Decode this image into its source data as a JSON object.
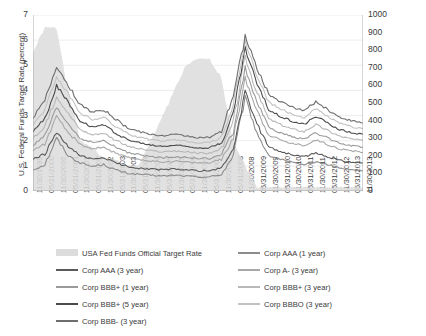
{
  "chart_data": {
    "type": "line",
    "title": "",
    "xlabel": "",
    "ylabel": "U.S. Federal Funds Target Rate (percent)",
    "y2label": "Korean Corporate Bond Spreads (basis points)",
    "ylim": [
      0,
      7
    ],
    "y2lim": [
      0,
      1000
    ],
    "grid": true,
    "legend_position": "bottom",
    "yticks": [
      "0",
      "1",
      "2",
      "3",
      "4",
      "5",
      "6",
      "7"
    ],
    "y2ticks": [
      "0",
      "100",
      "200",
      "300",
      "400",
      "500",
      "600",
      "700",
      "800",
      "900",
      "1000"
    ],
    "categories": [
      "11/30/1999",
      "05/31/2000",
      "11/30/2000",
      "05/31/2001",
      "11/30/2001",
      "05/31/2002",
      "11/30/2002",
      "05/31/2003",
      "11/30/2003",
      "05/31/2004",
      "11/30/2004",
      "05/31/2005",
      "11/30/2005",
      "05/31/2006",
      "11/30/2006",
      "05/31/2007",
      "11/30/2007",
      "05/31/2008",
      "11/30/2008",
      "05/31/2009",
      "11/30/2009",
      "05/31/2010",
      "11/30/2010",
      "05/31/2011",
      "11/30/2011",
      "05/31/2012",
      "11/30/2012",
      "05/31/2013",
      "11/30/2013"
    ],
    "area_series": {
      "name": "USA Fed Funds Official Target Rate",
      "axis": "left",
      "color": "#dcdcdc",
      "values": [
        5.5,
        6.5,
        6.5,
        4.0,
        2.0,
        1.75,
        1.25,
        1.25,
        1.0,
        1.0,
        2.0,
        3.0,
        4.0,
        5.0,
        5.25,
        5.25,
        4.5,
        2.0,
        1.0,
        0.15,
        0.15,
        0.15,
        0.15,
        0.15,
        0.15,
        0.15,
        0.15,
        0.15,
        0.15
      ]
    },
    "series": [
      {
        "name": "Corp AAA (1 year)",
        "axis": "right",
        "color": "#8c8c8c",
        "values": [
          120,
          150,
          300,
          200,
          160,
          140,
          150,
          120,
          100,
          95,
          90,
          85,
          90,
          85,
          80,
          80,
          95,
          200,
          530,
          330,
          200,
          180,
          160,
          150,
          165,
          150,
          130,
          120,
          115
        ]
      },
      {
        "name": "Corp AAA (3 year)",
        "axis": "right",
        "color": "#5a5a5a",
        "values": [
          180,
          210,
          330,
          250,
          200,
          180,
          190,
          160,
          140,
          130,
          125,
          120,
          125,
          120,
          115,
          115,
          130,
          240,
          560,
          380,
          250,
          225,
          205,
          195,
          215,
          195,
          175,
          165,
          160
        ]
      },
      {
        "name": "Corp A- (3 year)",
        "axis": "right",
        "color": "#a8a8a8",
        "values": [
          230,
          270,
          420,
          330,
          265,
          240,
          250,
          215,
          190,
          180,
          170,
          165,
          170,
          165,
          160,
          160,
          180,
          300,
          640,
          460,
          320,
          290,
          270,
          260,
          290,
          265,
          240,
          228,
          220
        ]
      },
      {
        "name": "Corp BBB+ (1 year)",
        "axis": "right",
        "color": "#9a9a9a",
        "values": [
          260,
          310,
          470,
          380,
          300,
          275,
          285,
          250,
          220,
          205,
          195,
          190,
          195,
          190,
          185,
          185,
          205,
          340,
          700,
          505,
          360,
          330,
          308,
          296,
          330,
          300,
          272,
          258,
          250
        ]
      },
      {
        "name": "Corp BBB+ (3 year)",
        "axis": "right",
        "color": "#b8b8b8",
        "values": [
          300,
          360,
          540,
          440,
          350,
          320,
          330,
          290,
          255,
          240,
          228,
          222,
          228,
          222,
          215,
          215,
          240,
          390,
          760,
          560,
          410,
          378,
          352,
          338,
          378,
          344,
          312,
          296,
          286
        ]
      },
      {
        "name": "Corp BBB+ (5 year)",
        "axis": "right",
        "color": "#4a4a4a",
        "values": [
          340,
          410,
          600,
          500,
          400,
          365,
          375,
          330,
          292,
          274,
          260,
          254,
          260,
          254,
          246,
          246,
          274,
          440,
          810,
          610,
          460,
          424,
          396,
          380,
          424,
          386,
          350,
          332,
          322
        ]
      },
      {
        "name": "Corp BBBO (3 year)",
        "axis": "right",
        "color": "#c2c2c2",
        "values": [
          380,
          460,
          650,
          550,
          445,
          405,
          418,
          368,
          326,
          306,
          290,
          284,
          290,
          284,
          275,
          275,
          306,
          490,
          850,
          655,
          505,
          466,
          436,
          418,
          466,
          424,
          385,
          366,
          354
        ]
      },
      {
        "name": "Corp BBB- (3 year)",
        "axis": "right",
        "color": "#6e6e6e",
        "values": [
          420,
          510,
          710,
          600,
          490,
          448,
          462,
          408,
          360,
          338,
          322,
          314,
          322,
          314,
          304,
          304,
          338,
          545,
          880,
          700,
          550,
          508,
          476,
          456,
          508,
          462,
          420,
          400,
          386
        ]
      }
    ]
  },
  "legend": {
    "items": [
      {
        "label": "USA Fed Funds Official Target Rate",
        "type": "area",
        "color": "#dcdcdc",
        "col": 0,
        "row": 0
      },
      {
        "label": "Corp AAA (1 year)",
        "type": "line",
        "color": "#8c8c8c",
        "col": 1,
        "row": 0
      },
      {
        "label": "Corp AAA (3 year)",
        "type": "line",
        "color": "#5a5a5a",
        "col": 0,
        "row": 1
      },
      {
        "label": "Corp A- (3 year)",
        "type": "line",
        "color": "#a8a8a8",
        "col": 1,
        "row": 1
      },
      {
        "label": "Corp BBB+ (1 year)",
        "type": "line",
        "color": "#9a9a9a",
        "col": 0,
        "row": 2
      },
      {
        "label": "Corp BBB+ (3 year)",
        "type": "line",
        "color": "#b8b8b8",
        "col": 1,
        "row": 2
      },
      {
        "label": "Corp BBB+ (5 year)",
        "type": "line",
        "color": "#4a4a4a",
        "col": 0,
        "row": 3
      },
      {
        "label": "Corp BBBO (3 year)",
        "type": "line",
        "color": "#c2c2c2",
        "col": 1,
        "row": 3
      },
      {
        "label": "Corp BBB- (3 year)",
        "type": "line",
        "color": "#6e6e6e",
        "col": 0,
        "row": 4
      }
    ]
  }
}
